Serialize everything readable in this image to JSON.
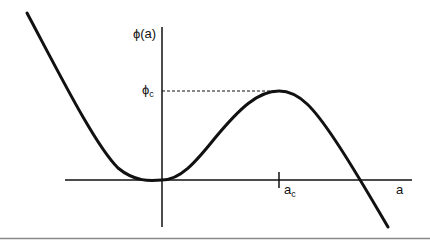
{
  "diagram": {
    "y_axis_label": "ϕ(a)",
    "x_axis_label": "a",
    "critical_value_label": "ϕ",
    "critical_value_sub": "c",
    "critical_point_label": "a",
    "critical_point_sub": "c",
    "curve_color": "#111111",
    "axis_color": "#111111",
    "rule_color": "#888888"
  }
}
